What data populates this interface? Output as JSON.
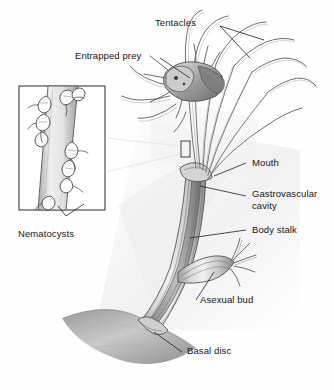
{
  "figure": {
    "style": "grayscale-pen-and-wash-biological-illustration",
    "background_color": "#fefefe",
    "ink_color": "#4a4a4a",
    "text_color": "#161616",
    "wash_light": "#e8e8e8",
    "wash_mid": "#c9c9c9",
    "wash_dark": "#8e8e8e"
  },
  "labels": {
    "tentacles": "Tentacles",
    "entrapped_prey": "Entrapped prey",
    "nematocysts": "Nematocysts",
    "mouth": "Mouth",
    "gastrovascular_cavity": "Gastrovascular cavity",
    "body_stalk": "Body stalk",
    "asexual_bud": "Asexual bud",
    "basal_disc": "Basal disc"
  },
  "structures": [
    {
      "name": "tentacles",
      "description": "long slender whip-like arms radiating from the oral end"
    },
    {
      "name": "entrapped-prey",
      "description": "small crustacean held by tentacles near the mouth"
    },
    {
      "name": "mouth",
      "description": "opening at the hypostome where tentacles converge"
    },
    {
      "name": "gastrovascular-cavity",
      "description": "hollow digestive cavity inside the column"
    },
    {
      "name": "body-stalk",
      "description": "elongated tubular column of the hydra"
    },
    {
      "name": "asexual-bud",
      "description": "lateral outgrowth with small developing tentacles"
    },
    {
      "name": "basal-disc",
      "description": "adhesive foot attaching the hydra to the substrate"
    },
    {
      "name": "nematocysts",
      "description": "stinging cells studding the tentacle surface, shown enlarged in inset"
    }
  ],
  "inset": {
    "name": "nematocyst-detail-inset",
    "description": "magnified rectangular view of a tentacle segment covered in nematocysts",
    "callout_marker": "small rectangle on the tentacle bundle"
  }
}
